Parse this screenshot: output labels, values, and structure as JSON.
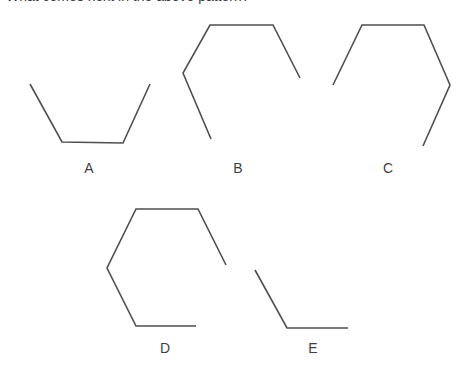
{
  "question": {
    "text": "What comes next in the above pattern?",
    "clipped": true
  },
  "figure": {
    "background_color": "#ffffff",
    "stroke_color": "#4f4f4f",
    "stroke_width": 1.6,
    "shapes": [
      {
        "label": "A",
        "name": "shape-a",
        "segment_count": 3,
        "description": "open cup: two slanted sides with a flat bottom",
        "points": "30,84 62,142 123,143 150,84"
      },
      {
        "label": "B",
        "name": "shape-b",
        "segment_count": 5,
        "description": "partial hexagon open on the lower right",
        "points": "211,139 183,73 210,25 273,25 300,78"
      },
      {
        "label": "C",
        "name": "shape-c",
        "segment_count": 5,
        "description": "partial hexagon open on the lower left, mirror of B",
        "points": "333,85 362,25 424,25 450,85 423,146"
      },
      {
        "label": "D",
        "name": "shape-d",
        "segment_count": 5,
        "description": "partial hexagon missing the lower right side",
        "points": "226,265 198,209 136,209 107,268 136,326 196,326"
      },
      {
        "label": "E",
        "name": "shape-e",
        "segment_count": 2,
        "description": "one slanted side joined to a flat bottom",
        "points": "255,270 287,328 348,328"
      }
    ]
  },
  "labels": {
    "a": "A",
    "b": "B",
    "c": "C",
    "d": "D",
    "e": "E"
  }
}
